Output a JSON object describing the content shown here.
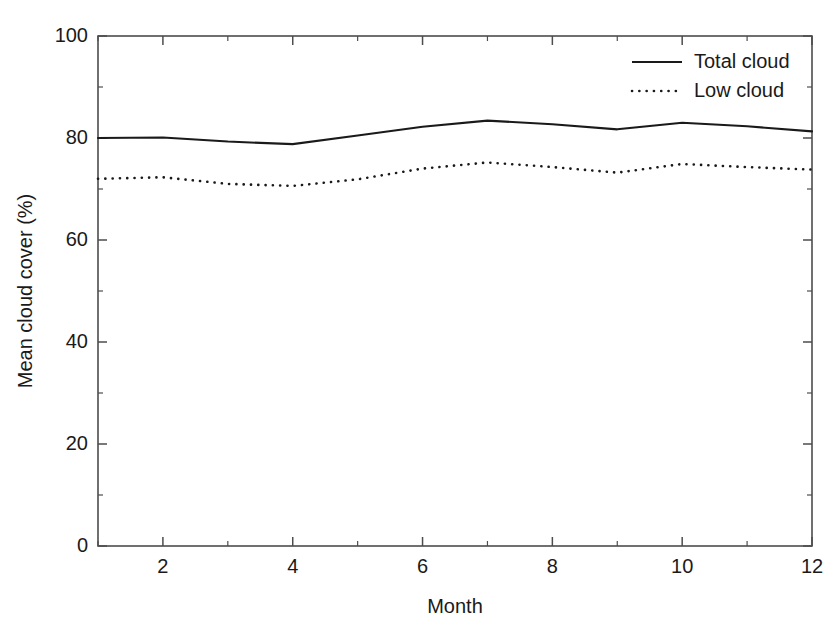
{
  "chart_data": {
    "type": "line",
    "title": "",
    "subtitle": "",
    "xlabel": "Month",
    "ylabel": "Mean cloud cover (%)",
    "xlim": [
      1,
      12
    ],
    "ylim": [
      0,
      100
    ],
    "grid": false,
    "legend_position": "top-right",
    "x": [
      1,
      2,
      3,
      4,
      5,
      6,
      7,
      8,
      9,
      10,
      11,
      12
    ],
    "x_tick_labels": [
      "2",
      "4",
      "6",
      "8",
      "10",
      "12"
    ],
    "x_tick_values": [
      2,
      4,
      6,
      8,
      10,
      12
    ],
    "x_minor_tick_values": [
      1,
      3,
      5,
      7,
      9,
      11
    ],
    "y_tick_labels": [
      "0",
      "20",
      "40",
      "60",
      "80",
      "100"
    ],
    "y_tick_values": [
      0,
      20,
      40,
      60,
      80,
      100
    ],
    "y_minor_tick_values": [
      10,
      30,
      50,
      70,
      90
    ],
    "series": [
      {
        "name": "Total cloud",
        "style": "solid",
        "color": "#1a1a1a",
        "values": [
          80.0,
          80.1,
          79.3,
          78.8,
          80.5,
          82.2,
          83.4,
          82.7,
          81.7,
          83.0,
          82.3,
          81.3
        ]
      },
      {
        "name": "Low cloud",
        "style": "dotted",
        "color": "#1a1a1a",
        "values": [
          72.0,
          72.3,
          71.0,
          70.6,
          71.9,
          74.0,
          75.2,
          74.3,
          73.2,
          74.9,
          74.3,
          73.8
        ]
      }
    ],
    "legend": [
      {
        "label": "Total cloud",
        "style": "solid"
      },
      {
        "label": "Low cloud",
        "style": "dotted"
      }
    ]
  }
}
